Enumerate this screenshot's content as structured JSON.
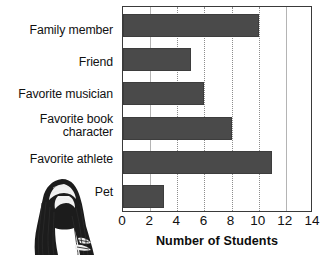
{
  "chart_data": {
    "type": "bar",
    "orientation": "horizontal",
    "title": "",
    "xlabel": "Number of Students",
    "ylabel": "",
    "categories": [
      "Family member",
      "Friend",
      "Favorite musician",
      "Favorite book character",
      "Favorite athlete",
      "Pet"
    ],
    "values": [
      10,
      5,
      6,
      8,
      11,
      3
    ],
    "xlim": [
      0,
      14
    ],
    "xticks": [
      0,
      2,
      4,
      6,
      8,
      10,
      12,
      14
    ],
    "xtick_labels": [
      "0",
      "2",
      "4",
      "6",
      "8",
      "10",
      "12",
      "14"
    ],
    "grid": "vertical-dotted",
    "legend": "none",
    "bar_color": "#4a4a4a",
    "border_color": "#3a3a3a",
    "grid_color": "#8d8d8d",
    "text_color": "#111111"
  },
  "labels": {
    "family_member": "Family member",
    "friend": "Friend",
    "favorite_musician": "Favorite musician",
    "favorite_book_character_line1": "Favorite book",
    "favorite_book_character_line2": "character",
    "favorite_athlete": "Favorite athlete",
    "pet": "Pet"
  },
  "axis": {
    "title": "Number of Students"
  },
  "illustration": {
    "name": "person-long-hair-engraving"
  }
}
